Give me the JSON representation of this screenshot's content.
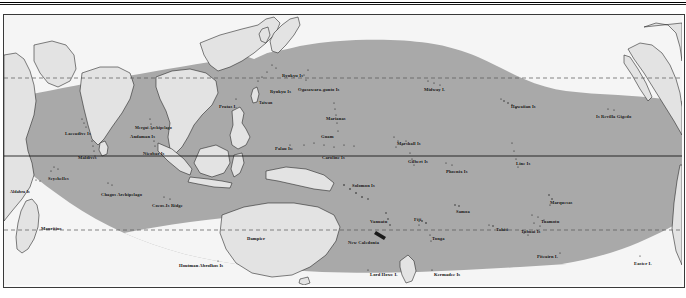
{
  "figure": {
    "kind": "map",
    "projection_extent_note": "Indo-Pacific tropical belt",
    "colors": {
      "ocean": "#f5f5f5",
      "shaded_range": "#a9a9a9",
      "landmass": "#e3e3e3",
      "coastline": "#1a1a1a",
      "frame": "#3a3a3a",
      "equator_line": "#111111",
      "tropic_line": "#555555",
      "label_text": "#0d0d0d"
    },
    "graticule": {
      "equator": {
        "style": "solid",
        "y": 141
      },
      "tropic_of_cancer": {
        "style": "dashed",
        "y": 63
      },
      "tropic_of_capricorn": {
        "style": "dashed",
        "y": 215
      }
    }
  },
  "labels": [
    {
      "id": "seychelles",
      "text": "Seychelles",
      "x": 44,
      "y": 161,
      "size": "s45"
    },
    {
      "id": "aldabra-is",
      "text": "Aldabra Is",
      "x": 6,
      "y": 174,
      "size": "s4"
    },
    {
      "id": "chagos-archipelago",
      "text": "Chagos Archipelago",
      "x": 97,
      "y": 177,
      "size": "s45"
    },
    {
      "id": "cocos-is-ridge",
      "text": "Cocos-Is Ridge",
      "x": 148,
      "y": 188,
      "size": "s45"
    },
    {
      "id": "mauritius",
      "text": "Mauritius",
      "x": 37,
      "y": 211,
      "size": "s45"
    },
    {
      "id": "laccadive-is",
      "text": "Laccadive Is",
      "x": 61,
      "y": 116,
      "size": "s45"
    },
    {
      "id": "maldives",
      "text": "Maldives",
      "x": 74,
      "y": 140,
      "size": "s45"
    },
    {
      "id": "mergui-archipelago",
      "text": "Mergui Archipelago",
      "x": 131,
      "y": 110,
      "size": "s4"
    },
    {
      "id": "andaman-is",
      "text": "Andaman Is",
      "x": 126,
      "y": 119,
      "size": "s45"
    },
    {
      "id": "nicobar-is",
      "text": "Nicobar Is",
      "x": 139,
      "y": 136,
      "size": "s45"
    },
    {
      "id": "houtman-abrolhos-is",
      "text": "Houtman Abrolhos Is",
      "x": 175,
      "y": 248,
      "size": "s45"
    },
    {
      "id": "dampier",
      "text": "Dampier",
      "x": 243,
      "y": 221,
      "size": "s45"
    },
    {
      "id": "pratas-i",
      "text": "Pratas I.",
      "x": 215,
      "y": 89,
      "size": "s45"
    },
    {
      "id": "taiwan",
      "text": "Taiwan",
      "x": 255,
      "y": 85,
      "size": "s4"
    },
    {
      "id": "ryukyu-is-north",
      "text": "Ryukyu Is",
      "x": 278,
      "y": 58,
      "size": "s45"
    },
    {
      "id": "ryukyu-is-south",
      "text": "Ryukyu Is",
      "x": 266,
      "y": 74,
      "size": "s45"
    },
    {
      "id": "ogasawara-gunto-is",
      "text": "Ogasawara-gunto Is",
      "x": 294,
      "y": 72,
      "size": "s45"
    },
    {
      "id": "marianas",
      "text": "Marianas",
      "x": 322,
      "y": 101,
      "size": "s45"
    },
    {
      "id": "guam",
      "text": "Guam",
      "x": 317,
      "y": 119,
      "size": "s45"
    },
    {
      "id": "palau-is",
      "text": "Palau Is",
      "x": 271,
      "y": 131,
      "size": "s45"
    },
    {
      "id": "caroline-is",
      "text": "Caroline Is",
      "x": 318,
      "y": 140,
      "size": "s45"
    },
    {
      "id": "midway-i",
      "text": "Midway I.",
      "x": 420,
      "y": 72,
      "size": "s45"
    },
    {
      "id": "hawaiian-is",
      "text": "Hawaiian Is",
      "x": 507,
      "y": 89,
      "size": "s45"
    },
    {
      "id": "is-revilla-gigedo",
      "text": "Is Revilla Gigedo",
      "x": 592,
      "y": 99,
      "size": "s45"
    },
    {
      "id": "marshall-is",
      "text": "Marshall Is",
      "x": 393,
      "y": 126,
      "size": "s45"
    },
    {
      "id": "gilbert-is",
      "text": "Gilbert Is",
      "x": 404,
      "y": 144,
      "size": "s45"
    },
    {
      "id": "phoenix-is",
      "text": "Phoenix Is",
      "x": 442,
      "y": 154,
      "size": "s45"
    },
    {
      "id": "line-is",
      "text": "Line Is",
      "x": 512,
      "y": 146,
      "size": "s45"
    },
    {
      "id": "solomon-is",
      "text": "Solomon Is",
      "x": 348,
      "y": 168,
      "size": "s45"
    },
    {
      "id": "vanuatu",
      "text": "Vanuatu",
      "x": 366,
      "y": 204,
      "size": "s45"
    },
    {
      "id": "new-caledonia",
      "text": "New Caledonia",
      "x": 344,
      "y": 225,
      "size": "s45"
    },
    {
      "id": "fiji",
      "text": "Fiji",
      "x": 410,
      "y": 202,
      "size": "s45"
    },
    {
      "id": "tonga",
      "text": "Tonga",
      "x": 428,
      "y": 221,
      "size": "s45"
    },
    {
      "id": "samoa",
      "text": "Samoa",
      "x": 452,
      "y": 194,
      "size": "s45"
    },
    {
      "id": "tahiti",
      "text": "Tahiti",
      "x": 492,
      "y": 212,
      "size": "s45"
    },
    {
      "id": "marquesas",
      "text": "Marquesas",
      "x": 546,
      "y": 185,
      "size": "s45"
    },
    {
      "id": "tuamotu",
      "text": "Tuamotu",
      "x": 537,
      "y": 204,
      "size": "s45"
    },
    {
      "id": "tubuai-is",
      "text": "Tubuai Is",
      "x": 517,
      "y": 214,
      "size": "s45"
    },
    {
      "id": "pitcairn-i",
      "text": "Pitcairn I.",
      "x": 533,
      "y": 239,
      "size": "s45"
    },
    {
      "id": "easter-i",
      "text": "Easter I.",
      "x": 630,
      "y": 246,
      "size": "s45"
    },
    {
      "id": "lord-howe-i",
      "text": "Lord Howe I.",
      "x": 366,
      "y": 257,
      "size": "s45"
    },
    {
      "id": "kermadec-is",
      "text": "Kermadec Is",
      "x": 430,
      "y": 257,
      "size": "s45"
    }
  ]
}
